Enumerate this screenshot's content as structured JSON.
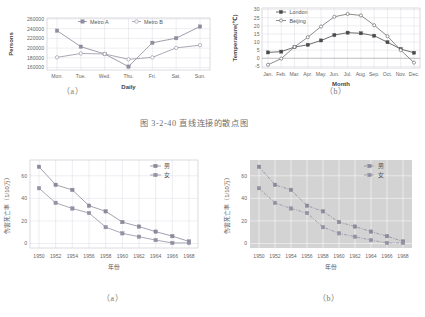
{
  "figure": {
    "main_caption": "图 3-2-40   直线连接的散点图",
    "sub_caption_top_a": "（a）",
    "sub_caption_top_b": "（b）",
    "sub_caption_bottom_a": "（a）",
    "sub_caption_bottom_b": "（b）"
  },
  "colors": {
    "metro_a": "#8e8e9e",
    "metro_b": "#9a9aa8",
    "london": "#4a4a4a",
    "beijing": "#6f6f6f",
    "male": "#8a8a9c",
    "female": "#9292a4",
    "grid": "#d9d9e2",
    "plot_gray": "#d3d3d3",
    "text": "#555555"
  },
  "chart_data": [
    {
      "id": "metro",
      "type": "line",
      "title": "",
      "xlabel": "Daily",
      "ylabel": "Persons",
      "categories": [
        "Mon.",
        "Tue.",
        "Wed.",
        "Thu.",
        "Fri.",
        "Sat.",
        "Sun."
      ],
      "ylim": [
        155000,
        262000
      ],
      "yticks": [
        160000,
        180000,
        200000,
        220000,
        240000,
        260000
      ],
      "ytick_labels": [
        "160000",
        "180000",
        "200000",
        "220000",
        "240000",
        "260000"
      ],
      "grid": true,
      "legend_position": "top",
      "series": [
        {
          "name": "Metro A",
          "values": [
            236000,
            203000,
            188000,
            162000,
            211000,
            220500,
            244500
          ]
        },
        {
          "name": "Metro B",
          "values": [
            181000,
            189000,
            188000,
            177000,
            181000,
            200500,
            206000
          ]
        }
      ]
    },
    {
      "id": "temperature",
      "type": "line",
      "title": "",
      "xlabel": "Month",
      "ylabel": "Temperature(℃)",
      "categories": [
        "Jan.",
        "Feb.",
        "Mar.",
        "Apr.",
        "May.",
        "Jun.",
        "Jul.",
        "Aug.",
        "Sep.",
        "Oct.",
        "Nov.",
        "Dec."
      ],
      "ylim": [
        -6,
        31
      ],
      "yticks": [
        -5,
        0,
        5,
        10,
        15,
        20,
        25,
        30
      ],
      "ytick_labels": [
        "-5",
        "0",
        "5",
        "10",
        "15",
        "20",
        "25",
        "30"
      ],
      "grid": true,
      "legend_position": "top-left",
      "series": [
        {
          "name": "London",
          "values": [
            3.6,
            4.1,
            6.9,
            8.3,
            11.0,
            14.3,
            15.8,
            15.4,
            13.9,
            9.9,
            5.7,
            3.4
          ]
        },
        {
          "name": "Beijing",
          "values": [
            -4.0,
            -0.2,
            7.0,
            13.0,
            19.6,
            25.6,
            27.3,
            26.4,
            20.4,
            13.6,
            5.0,
            -2.7
          ]
        }
      ]
    },
    {
      "id": "injury-mortality-a",
      "type": "line",
      "title": "",
      "xlabel": "年份",
      "ylabel": "伤害死亡率（1/10万）",
      "categories": [
        "1950",
        "1952",
        "1954",
        "1956",
        "1958",
        "1960",
        "1962",
        "1964",
        "1966",
        "1968"
      ],
      "ylim": [
        -4,
        74
      ],
      "yticks": [
        0,
        20,
        40,
        60
      ],
      "ytick_labels": [
        "0",
        "20",
        "40",
        "60"
      ],
      "grid": true,
      "legend_position": "top-right",
      "background": "white",
      "line_style": "solid",
      "series": [
        {
          "name": "男",
          "values": [
            68.0,
            52.0,
            47.5,
            33.5,
            28.5,
            19.0,
            15.0,
            10.5,
            6.5,
            1.8
          ]
        },
        {
          "name": "女",
          "values": [
            49.0,
            36.0,
            31.0,
            27.0,
            14.5,
            9.0,
            6.0,
            3.0,
            0.5,
            0.5
          ]
        }
      ]
    },
    {
      "id": "injury-mortality-b",
      "type": "line",
      "title": "",
      "xlabel": "年份",
      "ylabel": "伤害死亡率（1/10万）",
      "categories": [
        "1950",
        "1952",
        "1954",
        "1956",
        "1958",
        "1960",
        "1962",
        "1964",
        "1966",
        "1968"
      ],
      "ylim": [
        -4,
        74
      ],
      "yticks": [
        0,
        20,
        40,
        60
      ],
      "ytick_labels": [
        "0",
        "20",
        "40",
        "60"
      ],
      "grid": true,
      "legend_position": "top-right",
      "background": "gray",
      "line_style": "dashdot",
      "series": [
        {
          "name": "男",
          "values": [
            68.0,
            52.0,
            47.5,
            33.5,
            28.5,
            19.0,
            15.0,
            10.5,
            6.5,
            1.8
          ]
        },
        {
          "name": "女",
          "values": [
            49.0,
            36.0,
            31.0,
            27.0,
            14.5,
            9.0,
            6.0,
            3.0,
            0.5,
            0.5
          ]
        }
      ]
    }
  ]
}
